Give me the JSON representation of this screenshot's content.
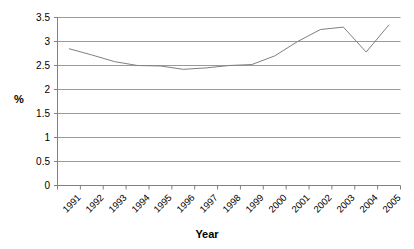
{
  "chart_data": {
    "type": "line",
    "title": "",
    "xlabel": "Year",
    "ylabel": "%",
    "categories": [
      "1991",
      "1992",
      "1993",
      "1994",
      "1995",
      "1996",
      "1997",
      "1998",
      "1999",
      "2000",
      "2001",
      "2002",
      "2003",
      "2004",
      "2005"
    ],
    "values": [
      2.85,
      2.72,
      2.58,
      2.5,
      2.49,
      2.42,
      2.45,
      2.5,
      2.52,
      2.7,
      3.0,
      3.25,
      3.3,
      2.78,
      3.35
    ],
    "series": [
      {
        "name": "percent",
        "values": [
          2.85,
          2.72,
          2.58,
          2.5,
          2.49,
          2.42,
          2.45,
          2.5,
          2.52,
          2.7,
          3.0,
          3.25,
          3.3,
          2.78,
          3.35
        ]
      }
    ],
    "ylim": [
      0,
      3.5
    ],
    "yticks": [
      0,
      0.5,
      1,
      1.5,
      2,
      2.5,
      3,
      3.5
    ],
    "ytick_labels": [
      "0",
      "0.5",
      "1",
      "1.5",
      "2",
      "2.5",
      "3",
      "3.5"
    ],
    "grid": true,
    "grid_axis": "y",
    "legend": "none",
    "line_color": "#808080",
    "grid_color": "#9a9a9a",
    "axis_color": "#808080",
    "background_color": "#ffffff"
  }
}
